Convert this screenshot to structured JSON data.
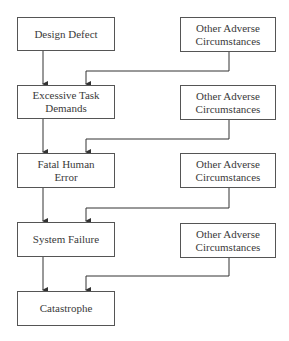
{
  "diagram": {
    "type": "flowchart",
    "chain": [
      {
        "id": "design_defect",
        "label": "Design Defect"
      },
      {
        "id": "excessive_task_demands",
        "label": "Excessive Task\nDemands"
      },
      {
        "id": "fatal_human_error",
        "label": "Fatal Human\nError"
      },
      {
        "id": "system_failure",
        "label": "System Failure"
      },
      {
        "id": "catastrophe",
        "label": "Catastrophe"
      }
    ],
    "side_factors": [
      {
        "id": "other_adverse_1",
        "label": "Other Adverse\nCircumstances",
        "feeds": "excessive_task_demands"
      },
      {
        "id": "other_adverse_2",
        "label": "Other Adverse\nCircumstances",
        "feeds": "fatal_human_error"
      },
      {
        "id": "other_adverse_3",
        "label": "Other Adverse\nCircumstances",
        "feeds": "system_failure"
      },
      {
        "id": "other_adverse_4",
        "label": "Other Adverse\nCircumstances",
        "feeds": "catastrophe"
      }
    ],
    "edges": [
      {
        "from": "design_defect",
        "to": "excessive_task_demands"
      },
      {
        "from": "other_adverse_1",
        "to": "excessive_task_demands"
      },
      {
        "from": "excessive_task_demands",
        "to": "fatal_human_error"
      },
      {
        "from": "other_adverse_2",
        "to": "fatal_human_error"
      },
      {
        "from": "fatal_human_error",
        "to": "system_failure"
      },
      {
        "from": "other_adverse_3",
        "to": "system_failure"
      },
      {
        "from": "system_failure",
        "to": "catastrophe"
      },
      {
        "from": "other_adverse_4",
        "to": "catastrophe"
      }
    ]
  },
  "colors": {
    "line": "#333333",
    "box_border": "#555555",
    "text": "#3a3a3a"
  }
}
